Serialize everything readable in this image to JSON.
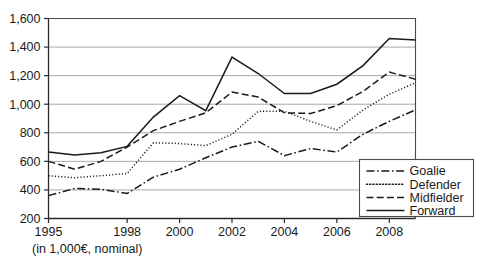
{
  "chart_data": {
    "type": "line",
    "title": "",
    "subtitle": "",
    "xlabel": "",
    "ylabel": "",
    "caption": "(in 1,000€, nominal)",
    "x": [
      1995,
      1996,
      1997,
      1998,
      1999,
      2000,
      2001,
      2002,
      2003,
      2004,
      2005,
      2006,
      2007,
      2008,
      2009
    ],
    "xlim": [
      1995,
      2009
    ],
    "ylim": [
      200,
      1600
    ],
    "ytick_values": [
      200,
      400,
      600,
      800,
      1000,
      1200,
      1400,
      1600
    ],
    "ytick_labels": [
      "200",
      "400",
      "600",
      "800",
      "1,000",
      "1,200",
      "1,400",
      "1,600"
    ],
    "xtick_values": [
      1995,
      1998,
      2000,
      2002,
      2004,
      2006,
      2008
    ],
    "xtick_labels": [
      "1995",
      "1998",
      "2000",
      "2002",
      "2004",
      "2006",
      "2008"
    ],
    "grid": true,
    "grid_axis": "y",
    "legend_position": "bottom-right",
    "series": [
      {
        "name": "Goalie",
        "dash_style": "dash-dot",
        "values": [
          360,
          410,
          405,
          375,
          490,
          545,
          625,
          700,
          740,
          640,
          690,
          665,
          790,
          880,
          960
        ]
      },
      {
        "name": "Defender",
        "dash_style": "dotted",
        "values": [
          500,
          485,
          500,
          515,
          730,
          725,
          710,
          790,
          950,
          950,
          880,
          820,
          960,
          1070,
          1150
        ]
      },
      {
        "name": "Midfielder",
        "dash_style": "dashed",
        "values": [
          600,
          545,
          600,
          700,
          815,
          880,
          940,
          1085,
          1050,
          940,
          935,
          990,
          1090,
          1225,
          1175
        ]
      },
      {
        "name": "Forward",
        "dash_style": "solid",
        "values": [
          665,
          645,
          660,
          705,
          910,
          1060,
          955,
          1330,
          1215,
          1075,
          1075,
          1140,
          1270,
          1460,
          1450
        ]
      }
    ]
  },
  "legend": {
    "items": [
      {
        "label": "Goalie"
      },
      {
        "label": "Defender"
      },
      {
        "label": "Midfielder"
      },
      {
        "label": "Forward"
      }
    ]
  }
}
